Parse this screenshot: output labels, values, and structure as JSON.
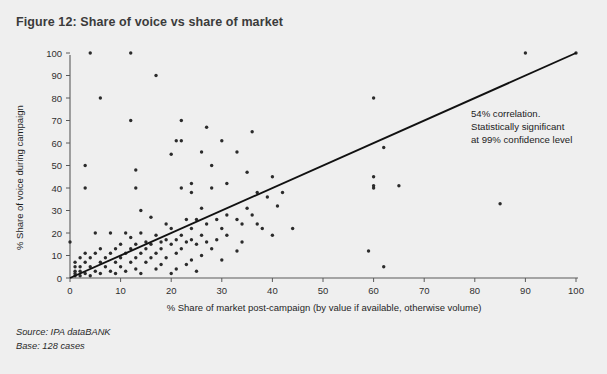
{
  "figure": {
    "title": "Figure 12: Share of voice vs share of market",
    "source": "Source: IPA dataBANK",
    "base": "Base: 128 cases"
  },
  "annotation": {
    "line1": "54% correlation.",
    "line2": "Statistically significant",
    "line3": "at 99% confidence level"
  },
  "colors": {
    "background": "#efefef",
    "title": "#3b3b3b",
    "point": "#2b2b2b",
    "trendline": "#111111",
    "axis": "#5a5a5a"
  },
  "chart_data": {
    "type": "scatter",
    "title": "Figure 12: Share of voice vs share of market",
    "xlabel": "% Share of market post-campaign (by value if available, otherwise volume)",
    "ylabel": "% Share of voice during campaign",
    "xlim": [
      0,
      100
    ],
    "ylim": [
      0,
      100
    ],
    "xticks": [
      0,
      10,
      20,
      30,
      40,
      50,
      60,
      70,
      80,
      90,
      100
    ],
    "yticks": [
      0,
      10,
      20,
      30,
      40,
      50,
      60,
      70,
      80,
      90,
      100
    ],
    "grid": false,
    "legend": null,
    "annotations": [
      {
        "text": "54% correlation. Statistically significant at 99% confidence level",
        "x": 70,
        "y": 70
      }
    ],
    "trendline": {
      "type": "linear",
      "x": [
        0,
        100
      ],
      "y": [
        0,
        100
      ],
      "correlation": 0.54,
      "significance": "99% confidence level"
    },
    "n_points": 128,
    "points": [
      [
        4,
        100
      ],
      [
        12,
        100
      ],
      [
        90,
        100
      ],
      [
        100,
        100
      ],
      [
        17,
        90
      ],
      [
        6,
        80
      ],
      [
        60,
        80
      ],
      [
        22,
        70
      ],
      [
        12,
        70
      ],
      [
        27,
        67
      ],
      [
        36,
        65
      ],
      [
        21,
        61
      ],
      [
        22,
        61
      ],
      [
        30,
        61
      ],
      [
        62,
        58
      ],
      [
        26,
        56
      ],
      [
        33,
        56
      ],
      [
        20,
        55
      ],
      [
        3,
        50
      ],
      [
        28,
        50
      ],
      [
        13,
        48
      ],
      [
        35,
        47
      ],
      [
        40,
        45
      ],
      [
        60,
        45
      ],
      [
        3,
        40
      ],
      [
        13,
        40
      ],
      [
        24,
        42
      ],
      [
        31,
        42
      ],
      [
        60,
        41
      ],
      [
        65,
        41
      ],
      [
        22,
        40
      ],
      [
        28,
        40
      ],
      [
        60,
        40
      ],
      [
        24,
        38
      ],
      [
        37,
        38
      ],
      [
        42,
        38
      ],
      [
        39,
        36
      ],
      [
        85,
        33
      ],
      [
        14,
        30
      ],
      [
        26,
        31
      ],
      [
        35,
        31
      ],
      [
        41,
        32
      ],
      [
        16,
        27
      ],
      [
        31,
        28
      ],
      [
        36,
        28
      ],
      [
        23,
        26
      ],
      [
        25,
        26
      ],
      [
        29,
        26
      ],
      [
        33,
        26
      ],
      [
        19,
        24
      ],
      [
        27,
        24
      ],
      [
        34,
        24
      ],
      [
        37,
        24
      ],
      [
        20,
        22
      ],
      [
        24,
        22
      ],
      [
        30,
        22
      ],
      [
        38,
        22
      ],
      [
        44,
        22
      ],
      [
        0,
        16
      ],
      [
        5,
        20
      ],
      [
        8,
        20
      ],
      [
        11,
        20
      ],
      [
        14,
        20
      ],
      [
        17,
        19
      ],
      [
        22,
        19
      ],
      [
        26,
        19
      ],
      [
        31,
        19
      ],
      [
        40,
        19
      ],
      [
        12,
        18
      ],
      [
        19,
        17
      ],
      [
        21,
        17
      ],
      [
        24,
        17
      ],
      [
        29,
        17
      ],
      [
        15,
        16
      ],
      [
        18,
        16
      ],
      [
        23,
        16
      ],
      [
        27,
        16
      ],
      [
        34,
        16
      ],
      [
        10,
        15
      ],
      [
        13,
        15
      ],
      [
        16,
        15
      ],
      [
        20,
        15
      ],
      [
        25,
        15
      ],
      [
        6,
        13
      ],
      [
        9,
        13
      ],
      [
        12,
        13
      ],
      [
        15,
        13
      ],
      [
        18,
        13
      ],
      [
        22,
        13
      ],
      [
        28,
        13
      ],
      [
        33,
        12
      ],
      [
        59,
        12
      ],
      [
        3,
        11
      ],
      [
        5,
        11
      ],
      [
        8,
        11
      ],
      [
        11,
        11
      ],
      [
        14,
        11
      ],
      [
        17,
        11
      ],
      [
        21,
        11
      ],
      [
        26,
        10
      ],
      [
        2,
        9
      ],
      [
        4,
        9
      ],
      [
        7,
        9
      ],
      [
        10,
        9
      ],
      [
        13,
        9
      ],
      [
        16,
        9
      ],
      [
        19,
        9
      ],
      [
        24,
        8
      ],
      [
        30,
        8
      ],
      [
        1,
        7
      ],
      [
        3,
        7
      ],
      [
        6,
        7
      ],
      [
        9,
        7
      ],
      [
        12,
        7
      ],
      [
        15,
        7
      ],
      [
        18,
        6
      ],
      [
        23,
        6
      ],
      [
        62,
        5
      ],
      [
        1,
        5
      ],
      [
        2,
        5
      ],
      [
        4,
        5
      ],
      [
        7,
        5
      ],
      [
        10,
        5
      ],
      [
        13,
        4
      ],
      [
        17,
        4
      ],
      [
        21,
        4
      ],
      [
        1,
        3
      ],
      [
        2,
        3
      ],
      [
        5,
        3
      ],
      [
        8,
        3
      ],
      [
        11,
        3
      ],
      [
        1,
        2
      ],
      [
        3,
        2
      ],
      [
        6,
        2
      ],
      [
        9,
        2
      ],
      [
        1,
        1
      ],
      [
        2,
        1
      ],
      [
        4,
        1
      ],
      [
        14,
        2
      ],
      [
        20,
        2
      ],
      [
        25,
        3
      ]
    ]
  }
}
